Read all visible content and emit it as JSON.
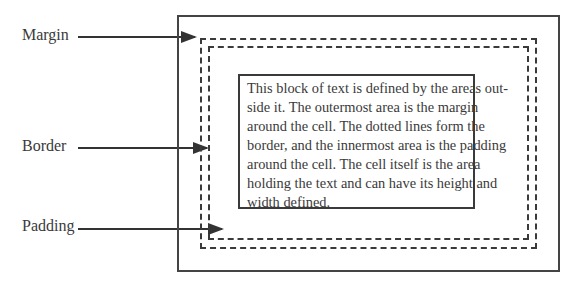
{
  "diagram": {
    "labels": {
      "margin": "Margin",
      "border": "Border",
      "padding": "Padding"
    },
    "cell_text_lines": [
      "This block of text is defined by the areas out-",
      "side it. The outermost area is the margin",
      "around the cell. The dotted lines form the",
      "border, and the innermost area is the padding",
      "around the cell. The cell itself is the area",
      "holding the text and can have its height and",
      "width defined."
    ],
    "colors": {
      "line": "#333333",
      "text": "#3a3a3a",
      "background": "#ffffff"
    }
  }
}
